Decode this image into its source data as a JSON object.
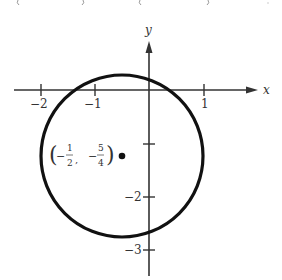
{
  "figure": {
    "type": "circle-graph",
    "axes": {
      "x_label": "x",
      "y_label": "y",
      "x_ticks": [
        {
          "value": -2,
          "label": "−2"
        },
        {
          "value": -1,
          "label": "−1"
        },
        {
          "value": 1,
          "label": "1"
        }
      ],
      "y_ticks": [
        {
          "value": -1,
          "label": ""
        },
        {
          "value": -2,
          "label": "−2"
        },
        {
          "value": -3,
          "label": "−3"
        }
      ]
    },
    "circle": {
      "center_x": -0.5,
      "center_y": -1.25,
      "radius": 1.5,
      "stroke": "#111111"
    },
    "center_label": {
      "open": "(",
      "x_sign": "−",
      "x_num": "1",
      "x_den": "2",
      "sep": ",",
      "y_sign": "−",
      "y_num": "5",
      "y_den": "4",
      "close": ")"
    },
    "top_fragments": [
      "(",
      ")",
      "(",
      ")",
      "·"
    ]
  }
}
